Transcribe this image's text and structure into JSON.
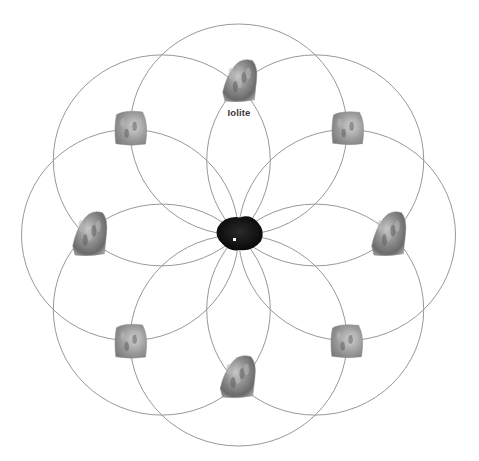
{
  "diagram": {
    "center": {
      "x": 238.5,
      "y": 235
    },
    "circle_radius_x": 108.5,
    "circle_radius_y": 105.5,
    "circle_count": 8,
    "line_color": "#8c8c8c",
    "background": "#ffffff",
    "central_stone": {
      "name": "central-stone",
      "color": "#111111",
      "x": 240,
      "y": 233,
      "w": 50,
      "h": 37
    },
    "stones": [
      {
        "position": "top",
        "shape": "point",
        "x": 240,
        "y": 80,
        "w": 36,
        "h": 44
      },
      {
        "position": "top-right",
        "shape": "block",
        "x": 348,
        "y": 128,
        "w": 33,
        "h": 34
      },
      {
        "position": "right",
        "shape": "point",
        "x": 389,
        "y": 233,
        "w": 36,
        "h": 46
      },
      {
        "position": "bottom-right",
        "shape": "block",
        "x": 347,
        "y": 341,
        "w": 33,
        "h": 34
      },
      {
        "position": "bottom",
        "shape": "point",
        "x": 238,
        "y": 376,
        "w": 37,
        "h": 44
      },
      {
        "position": "bottom-left",
        "shape": "block",
        "x": 131,
        "y": 341,
        "w": 33,
        "h": 35
      },
      {
        "position": "left",
        "shape": "point",
        "x": 90,
        "y": 233,
        "w": 36,
        "h": 46
      },
      {
        "position": "top-left",
        "shape": "block",
        "x": 131,
        "y": 128,
        "w": 33,
        "h": 35
      }
    ],
    "labels": [
      {
        "text": "Iolite",
        "x": 239,
        "y": 112
      }
    ]
  }
}
